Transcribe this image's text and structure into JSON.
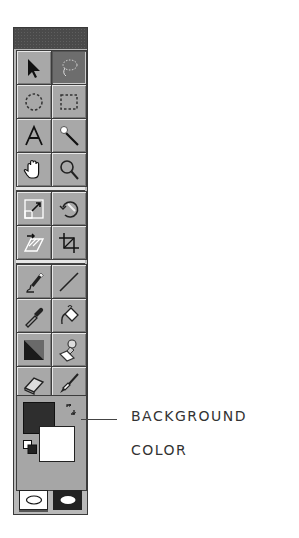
{
  "toolbox": {
    "title": "",
    "groups": [
      {
        "tools": [
          {
            "name": "Move tool",
            "icon": "arrow-pointer-icon",
            "selected": false
          },
          {
            "name": "Lasso tool",
            "icon": "lasso-icon",
            "selected": true
          },
          {
            "name": "Elliptical marquee tool",
            "icon": "elliptical-marquee-icon",
            "selected": false
          },
          {
            "name": "Rectangular marquee tool",
            "icon": "rectangular-marquee-icon",
            "selected": false
          },
          {
            "name": "Type tool",
            "icon": "type-icon",
            "glyph": "A",
            "selected": false
          },
          {
            "name": "Magic wand tool",
            "icon": "magic-wand-icon",
            "selected": false
          },
          {
            "name": "Hand tool",
            "icon": "hand-icon",
            "selected": false
          },
          {
            "name": "Zoom tool",
            "icon": "magnifier-icon",
            "selected": false
          }
        ]
      },
      {
        "tools": [
          {
            "name": "Scale tool",
            "icon": "scale-icon",
            "selected": false
          },
          {
            "name": "Rotate tool",
            "icon": "rotate-icon",
            "selected": false
          },
          {
            "name": "Skew tool",
            "icon": "skew-icon",
            "selected": false
          },
          {
            "name": "Crop tool",
            "icon": "crop-icon",
            "selected": false
          }
        ]
      },
      {
        "tools": [
          {
            "name": "Pencil tool",
            "icon": "pencil-icon",
            "selected": false
          },
          {
            "name": "Line tool",
            "icon": "line-icon",
            "selected": false
          },
          {
            "name": "Eyedropper tool",
            "icon": "eyedropper-icon",
            "selected": false
          },
          {
            "name": "Paint bucket tool",
            "icon": "paint-bucket-icon",
            "selected": false
          },
          {
            "name": "Gradient tool",
            "icon": "gradient-icon",
            "selected": false
          },
          {
            "name": "Rubber stamp tool",
            "icon": "rubber-stamp-icon",
            "selected": false
          },
          {
            "name": "Eraser tool",
            "icon": "eraser-icon",
            "selected": false
          },
          {
            "name": "Paintbrush tool",
            "icon": "paintbrush-icon",
            "selected": false
          }
        ]
      }
    ],
    "colors": {
      "foreground": "#2e2e2e",
      "background": "#ffffff"
    },
    "modes": [
      {
        "name": "Standard mode",
        "icon": "standard-mode-icon",
        "active": true
      },
      {
        "name": "Quick mask mode",
        "icon": "quick-mask-icon",
        "active": false
      }
    ]
  },
  "callout": {
    "line1": "BACKGROUND",
    "line2": "COLOR"
  }
}
